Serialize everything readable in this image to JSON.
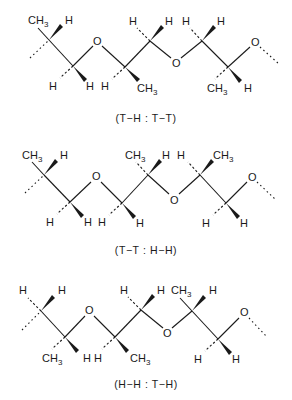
{
  "figure": {
    "atom_labels": {
      "methyl": "CH",
      "methyl_subscript": "3",
      "hydrogen": "H",
      "oxygen": "O"
    },
    "structures": [
      {
        "id": "structure-1",
        "caption": "(T−H : T−T)",
        "substituents_c1": {
          "up": "CH3",
          "wedge": "H"
        },
        "substituents_c2": {
          "dash": "H",
          "wedge": "H"
        },
        "substituents_c3": {
          "dash": "H",
          "wedge": "CH3"
        },
        "substituents_c4": {
          "dash": "H",
          "wedge": "H"
        },
        "substituents_c5": {
          "dash": "H",
          "wedge": "H"
        },
        "substituents_c6": {
          "dash": "CH3",
          "wedge": "H"
        }
      },
      {
        "id": "structure-2",
        "caption": "(T−T : H−H)",
        "substituents_c1": {
          "up": "CH3",
          "wedge": "H"
        },
        "substituents_c2": {
          "dash": "H",
          "wedge": "H"
        },
        "substituents_c3": {
          "dash": "H",
          "wedge": "H"
        },
        "substituents_c4": {
          "dash": "CH3",
          "wedge": "H"
        },
        "substituents_c5": {
          "dash": "H",
          "wedge": "CH3"
        },
        "substituents_c6": {
          "dash": "H",
          "wedge": "H"
        }
      },
      {
        "id": "structure-3",
        "caption": "(H−H : T−H)",
        "substituents_c1": {
          "dash": "H",
          "wedge": "H"
        },
        "substituents_c2": {
          "dash": "CH3",
          "wedge": "H"
        },
        "substituents_c3": {
          "dash": "H",
          "wedge": "CH3"
        },
        "substituents_c4": {
          "dash": "H",
          "wedge": "H"
        },
        "substituents_c5": {
          "dash": "CH3",
          "wedge": "H"
        },
        "substituents_c6": {
          "dash": "H",
          "wedge": "H"
        }
      }
    ]
  }
}
